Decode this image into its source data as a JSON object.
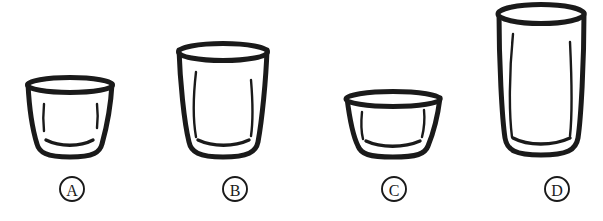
{
  "figure": {
    "background_color": "#ffffff",
    "ink_color": "#1a1a1a",
    "width": 603,
    "height": 221
  },
  "glasses": [
    {
      "id": "glass-a",
      "label": "A",
      "label_glyph": "Ⓐ",
      "description": "short wide tumbler, slight taper",
      "top_y": 80,
      "bottom_y": 157,
      "top_left_x": 27,
      "top_right_x": 113,
      "bottom_left_x": 36,
      "bottom_right_x": 102,
      "rim_ellipse_ry": 8,
      "stroke_width": 5,
      "label_center_x": 72,
      "label_center_y": 189,
      "label_radius": 12
    },
    {
      "id": "glass-b",
      "label": "B",
      "label_glyph": "Ⓑ",
      "description": "tall wide tumbler, moderate taper",
      "top_y": 45,
      "bottom_y": 157,
      "top_left_x": 178,
      "top_right_x": 268,
      "bottom_left_x": 190,
      "bottom_right_x": 258,
      "rim_ellipse_ry": 9,
      "stroke_width": 5,
      "label_center_x": 235,
      "label_center_y": 189,
      "label_radius": 12
    },
    {
      "id": "glass-c",
      "label": "C",
      "label_glyph": "Ⓒ",
      "description": "very short wide bowl, strong taper",
      "top_y": 94,
      "bottom_y": 157,
      "top_left_x": 346,
      "top_right_x": 441,
      "bottom_left_x": 359,
      "bottom_right_x": 428,
      "rim_ellipse_ry": 8,
      "stroke_width": 5,
      "label_center_x": 394,
      "label_center_y": 189,
      "label_radius": 12
    },
    {
      "id": "glass-d",
      "label": "D",
      "label_glyph": "Ⓓ",
      "description": "tallest narrow glass, nearly straight sides",
      "top_y": 6,
      "bottom_y": 155,
      "top_left_x": 498,
      "top_right_x": 585,
      "bottom_left_x": 506,
      "bottom_right_x": 578,
      "rim_ellipse_ry": 10,
      "stroke_width": 5,
      "label_center_x": 557,
      "label_center_y": 189,
      "label_radius": 12
    }
  ]
}
